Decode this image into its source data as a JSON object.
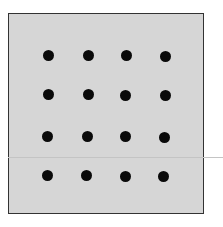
{
  "figure": {
    "background": "#d6d6d6",
    "border": "#333333",
    "dot_color": "#0a0a0a",
    "grid": {
      "rows": 4,
      "cols": 4
    },
    "dots": [
      {
        "x": 48,
        "y": 55
      },
      {
        "x": 88,
        "y": 55
      },
      {
        "x": 126,
        "y": 55
      },
      {
        "x": 165,
        "y": 56
      },
      {
        "x": 48,
        "y": 94
      },
      {
        "x": 88,
        "y": 94
      },
      {
        "x": 125,
        "y": 95
      },
      {
        "x": 165,
        "y": 95
      },
      {
        "x": 47,
        "y": 136
      },
      {
        "x": 87,
        "y": 136
      },
      {
        "x": 125,
        "y": 136
      },
      {
        "x": 164,
        "y": 137
      },
      {
        "x": 47,
        "y": 175
      },
      {
        "x": 86,
        "y": 175
      },
      {
        "x": 125,
        "y": 176
      },
      {
        "x": 163,
        "y": 176
      }
    ]
  }
}
